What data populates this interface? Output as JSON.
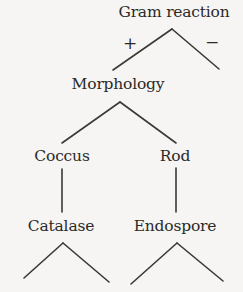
{
  "diagram": {
    "type": "dichotomous-key-tree",
    "title": "Gram reaction",
    "background_color": "#f6f5f3",
    "line_color": "#3a3936",
    "text_color": "#2b2a28",
    "nodes": [
      {
        "id": "gram-reaction",
        "label": "Gram reaction",
        "level": 0
      },
      {
        "id": "morphology",
        "label": "Morphology",
        "level": 1
      },
      {
        "id": "coccus",
        "label": "Coccus",
        "level": 2
      },
      {
        "id": "rod",
        "label": "Rod",
        "level": 2
      },
      {
        "id": "catalase",
        "label": "Catalase",
        "level": 3
      },
      {
        "id": "endospore",
        "label": "Endospore",
        "level": 3
      }
    ],
    "edge_labels": {
      "gram_positive": "+",
      "gram_negative": "−"
    },
    "branches": [
      {
        "from": "gram-reaction",
        "to": "morphology",
        "label": "+"
      },
      {
        "from": "gram-reaction",
        "to": "unlabeled-right",
        "label": "−"
      },
      {
        "from": "morphology",
        "to": "coccus",
        "label": ""
      },
      {
        "from": "morphology",
        "to": "rod",
        "label": ""
      },
      {
        "from": "coccus",
        "to": "catalase",
        "label": ""
      },
      {
        "from": "rod",
        "to": "endospore",
        "label": ""
      },
      {
        "from": "catalase",
        "to": "leaf-cat-left",
        "label": ""
      },
      {
        "from": "catalase",
        "to": "leaf-cat-right",
        "label": ""
      },
      {
        "from": "endospore",
        "to": "leaf-end-left",
        "label": ""
      },
      {
        "from": "endospore",
        "to": "leaf-end-right",
        "label": ""
      }
    ]
  }
}
